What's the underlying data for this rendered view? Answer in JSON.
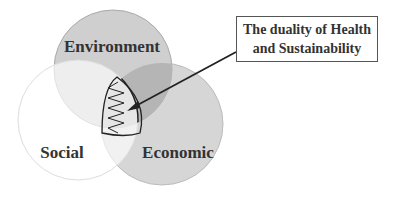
{
  "diagram": {
    "type": "venn",
    "circles": [
      {
        "label": "Environment",
        "fill": "#c8c8c8"
      },
      {
        "label": "Social",
        "fill": "#ffffff"
      },
      {
        "label": "Economic",
        "fill": "#d0d0d0"
      }
    ],
    "callout": {
      "line1": "The duality of Health",
      "line2": "and Sustainability"
    }
  }
}
